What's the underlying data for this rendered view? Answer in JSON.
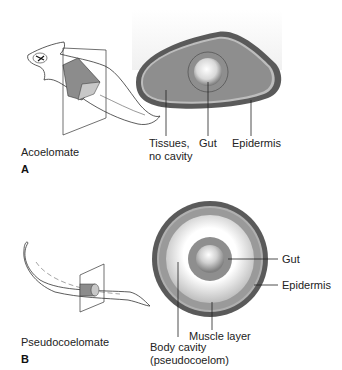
{
  "panels": [
    {
      "letter": "A",
      "organism_label": "Acoelomate",
      "labels": {
        "tissues": "Tissues,",
        "tissues_line2": "no cavity",
        "gut": "Gut",
        "epidermis": "Epidermis"
      }
    },
    {
      "letter": "B",
      "organism_label": "Pseudocoelomate",
      "labels": {
        "gut": "Gut",
        "epidermis": "Epidermis",
        "muscle": "Muscle layer",
        "cavity": "Body cavity",
        "cavity_line2": "(pseudocoelom)"
      }
    }
  ],
  "colors": {
    "epidermis": "#5a5a5a",
    "tissue": "#8e8e8e",
    "muscle": "#9a9a9a",
    "cavity": "#f4f4f4",
    "outline": "#333333"
  }
}
